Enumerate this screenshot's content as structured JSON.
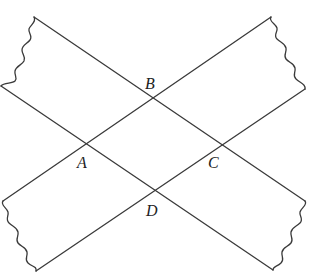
{
  "diagram": {
    "line_color": "#3a3a3a",
    "points": {
      "A": {
        "label": "A",
        "x": 85,
        "y": 145
      },
      "B": {
        "label": "B",
        "x": 153,
        "y": 97
      },
      "C": {
        "label": "C",
        "x": 222,
        "y": 145
      },
      "D": {
        "label": "D",
        "x": 154,
        "y": 193
      }
    },
    "strips": [
      {
        "name": "descending-strip",
        "upper_edge": [
          [
            34,
            17
          ],
          [
            305,
            201
          ]
        ],
        "lower_edge": [
          [
            1,
            86
          ],
          [
            273,
            270
          ]
        ],
        "torn_ends": [
          "left",
          "right"
        ]
      },
      {
        "name": "ascending-strip",
        "upper_edge": [
          [
            3,
            201
          ],
          [
            271,
            17
          ]
        ],
        "lower_edge": [
          [
            36,
            271
          ],
          [
            305,
            89
          ]
        ],
        "torn_ends": [
          "left",
          "right"
        ]
      }
    ]
  }
}
